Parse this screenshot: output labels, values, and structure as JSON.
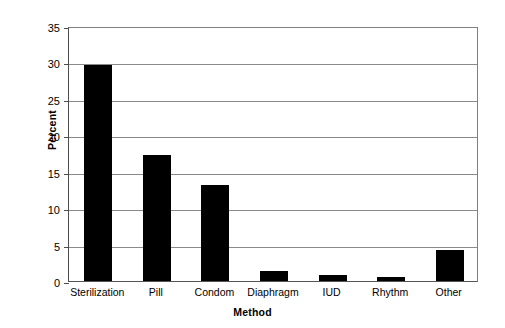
{
  "chart_data": {
    "type": "bar",
    "title": "",
    "xlabel": "Method",
    "ylabel": "Percent",
    "categories": [
      "Sterilization",
      "Pill",
      "Condom",
      "Diaphragm",
      "IUD",
      "Rhythm",
      "Other"
    ],
    "values": [
      29.7,
      17.3,
      13.2,
      1.4,
      0.8,
      0.5,
      4.2
    ],
    "ylim": [
      0,
      35
    ],
    "yticks": [
      0,
      5,
      10,
      15,
      20,
      25,
      30,
      35
    ],
    "ytick_labels": [
      "0",
      "5",
      "10",
      "15",
      "20",
      "25",
      "30",
      "35"
    ],
    "grid": true,
    "legend": false,
    "bar_color": "#000000",
    "grid_color": "#8a8a8a",
    "axis_color": "#4d4d4d",
    "background": "#ffffff"
  }
}
